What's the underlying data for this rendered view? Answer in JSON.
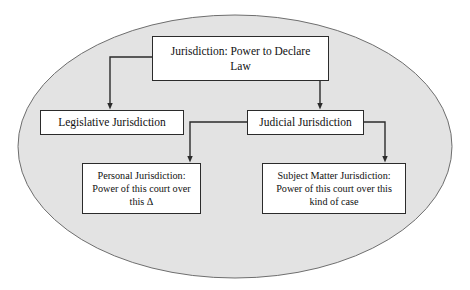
{
  "diagram": {
    "title": "Jurisdiction: Power to Declare Law",
    "background_color": "#ffffff",
    "ellipse": {
      "name": "jurisdiction-ellipse",
      "fill_color": "#e3e3e3",
      "stroke_color": "#6e6e6e"
    },
    "node_style": {
      "fill_color": "#ffffff",
      "stroke_color": "#2b2b2b",
      "text_color": "#111111"
    },
    "connector_color": "#333333",
    "nodes": [
      {
        "id": "root",
        "label": "Jurisdiction: Power to Declare\nLaw",
        "level": "root"
      },
      {
        "id": "legislative",
        "label": "Legislative Jurisdiction",
        "level": "branch"
      },
      {
        "id": "judicial",
        "label": "Judicial Jurisdiction",
        "level": "branch"
      },
      {
        "id": "personal",
        "label": "Personal  Jurisdiction:\nPower of this court over\nthis Δ",
        "level": "leaf"
      },
      {
        "id": "subject_matter",
        "label": "Subject Matter Jurisdiction:\nPower of this court over this\nkind of case",
        "level": "leaf"
      }
    ],
    "connectors": [
      {
        "id": "root-to-legislative",
        "from": "root",
        "to": "legislative",
        "style": "elbow-arrow"
      },
      {
        "id": "root-to-judicial",
        "from": "root",
        "to": "judicial",
        "style": "elbow-arrow"
      },
      {
        "id": "judicial-to-personal",
        "from": "judicial",
        "to": "personal",
        "style": "elbow-arrow"
      },
      {
        "id": "judicial-to-subject",
        "from": "judicial",
        "to": "subject_matter",
        "style": "elbow-arrow"
      }
    ]
  }
}
